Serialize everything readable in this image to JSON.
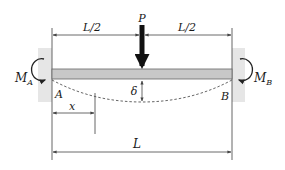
{
  "diagram": {
    "type": "fixed-fixed beam with central point load",
    "labels": {
      "load": "P",
      "half_span_left": "L/2",
      "half_span_right": "L/2",
      "moment_left": "M",
      "moment_left_sub": "A",
      "moment_right": "M",
      "moment_right_sub": "B",
      "support_left": "A",
      "support_right": "B",
      "deflection": "δ",
      "position": "x",
      "span": "L"
    },
    "colors": {
      "beam_fill": "#c8c8c8",
      "beam_edge": "#555555",
      "wall": "#e6e6e6",
      "line": "#444444",
      "load": "#111111"
    }
  }
}
